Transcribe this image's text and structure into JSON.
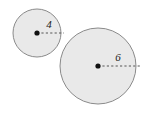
{
  "figure": {
    "type": "geometry-diagram",
    "background_color": "#ffffff",
    "canvas": {
      "width": 147,
      "height": 114
    },
    "style": {
      "circle_fill": "#e9e9e9",
      "circle_stroke": "#8a8a8a",
      "circle_stroke_width": 1,
      "center_dot_color": "#111111",
      "center_dot_radius": 2.6,
      "radius_line_color": "#555555",
      "radius_line_width": 1,
      "radius_dash_pattern": "2.2 2.2",
      "label_color": "#1a1a1a",
      "label_font_size": 11
    },
    "shapes": [
      {
        "name": "small-circle",
        "cx": 37,
        "cy": 33,
        "r": 24,
        "radius_label": "4",
        "label_x": 49,
        "label_y": 28,
        "radius_line": {
          "x1": 37,
          "y1": 33,
          "x2": 64,
          "y2": 33
        }
      },
      {
        "name": "large-circle",
        "cx": 98,
        "cy": 66,
        "r": 38,
        "radius_label": "6",
        "label_x": 118,
        "label_y": 61,
        "radius_line": {
          "x1": 98,
          "y1": 66,
          "x2": 142,
          "y2": 66
        }
      }
    ]
  }
}
